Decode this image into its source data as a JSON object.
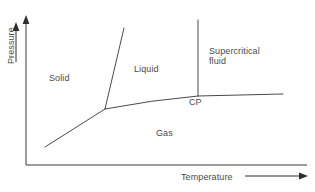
{
  "figure": {
    "type": "phase-diagram",
    "background_color": "#ffffff",
    "line_color": "#4a4a4a",
    "text_color": "#4a4a4a"
  },
  "axes": {
    "y_label": "Pressure",
    "x_label": "Temperature",
    "origin": [
      26,
      165
    ],
    "y_top": [
      26,
      18
    ],
    "x_right": [
      307,
      165
    ],
    "ticks": [],
    "grid": false
  },
  "regions": [
    {
      "name": "solid",
      "label": "Solid",
      "x": 49,
      "y": 73
    },
    {
      "name": "liquid",
      "label": "Liquid",
      "x": 134,
      "y": 64
    },
    {
      "name": "gas",
      "label": "Gas",
      "x": 156,
      "y": 128
    },
    {
      "name": "supercritical-fluid",
      "label_line1": "Supercritical",
      "label_line2": "fluid",
      "x": 209,
      "y": 46
    }
  ],
  "points": [
    {
      "name": "triple-point",
      "label": "",
      "x": 105,
      "y": 109
    },
    {
      "name": "critical-point",
      "label": "CP",
      "x": 198,
      "y": 96
    }
  ],
  "boundaries": [
    {
      "name": "sublimation-curve",
      "from": [
        45,
        147
      ],
      "to": [
        105,
        109
      ]
    },
    {
      "name": "fusion-curve",
      "from": [
        105,
        109
      ],
      "to": [
        124,
        28
      ]
    },
    {
      "name": "vaporization-curve",
      "from": [
        105,
        109
      ],
      "to": [
        198,
        96
      ]
    },
    {
      "name": "supercritical-vertical-line",
      "from": [
        198,
        96
      ],
      "to": [
        198,
        20
      ]
    },
    {
      "name": "supercritical-horizontal-line",
      "from": [
        198,
        96
      ],
      "to": [
        283,
        94
      ]
    }
  ],
  "annotations": {
    "cp_label": "CP"
  }
}
